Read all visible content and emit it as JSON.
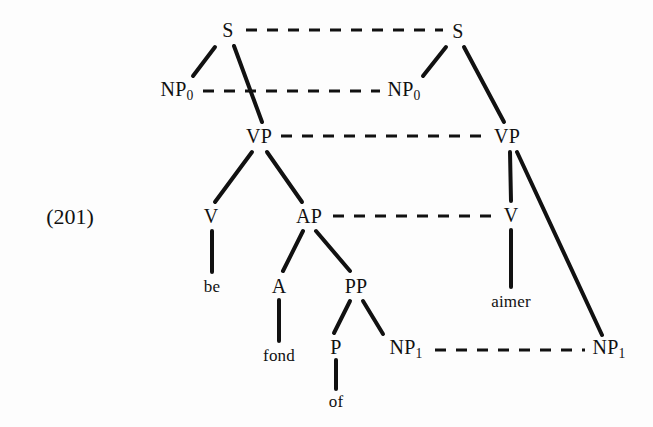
{
  "example": {
    "number_label": "(201)",
    "x": 70,
    "y": 217
  },
  "diagram": {
    "type": "syntactic-tree-pair",
    "background_color": "#fdfdfd",
    "line_color": "#111111",
    "solid_stroke_width": 4,
    "dashed_stroke_width": 3,
    "dash_pattern": "11 10"
  },
  "nodes": [
    {
      "id": "s-left",
      "label": "S",
      "sub": "",
      "kind": "category",
      "side": "left",
      "x": 228,
      "y": 30
    },
    {
      "id": "s-right",
      "label": "S",
      "sub": "",
      "kind": "category",
      "side": "right",
      "x": 458,
      "y": 31
    },
    {
      "id": "np0-left",
      "label": "NP",
      "sub": "0",
      "kind": "category",
      "side": "left",
      "x": 177,
      "y": 91
    },
    {
      "id": "np0-right",
      "label": "NP",
      "sub": "0",
      "kind": "category",
      "side": "right",
      "x": 404,
      "y": 91
    },
    {
      "id": "vp-left",
      "label": "VP",
      "sub": "",
      "kind": "category",
      "side": "left",
      "x": 259,
      "y": 136
    },
    {
      "id": "vp-right",
      "label": "VP",
      "sub": "",
      "kind": "category",
      "side": "right",
      "x": 507,
      "y": 136
    },
    {
      "id": "v-left",
      "label": "V",
      "sub": "",
      "kind": "category",
      "side": "left",
      "x": 211,
      "y": 216
    },
    {
      "id": "ap-left",
      "label": "AP",
      "sub": "",
      "kind": "category",
      "side": "left",
      "x": 309,
      "y": 216
    },
    {
      "id": "v-right",
      "label": "V",
      "sub": "",
      "kind": "category",
      "side": "right",
      "x": 511,
      "y": 215
    },
    {
      "id": "be",
      "label": "be",
      "sub": "",
      "kind": "word",
      "side": "left",
      "x": 212,
      "y": 286
    },
    {
      "id": "a-left",
      "label": "A",
      "sub": "",
      "kind": "category",
      "side": "left",
      "x": 279,
      "y": 286
    },
    {
      "id": "pp-left",
      "label": "PP",
      "sub": "",
      "kind": "category",
      "side": "left",
      "x": 356,
      "y": 286
    },
    {
      "id": "aimer",
      "label": "aimer",
      "sub": "",
      "kind": "word",
      "side": "right",
      "x": 511,
      "y": 301
    },
    {
      "id": "fond",
      "label": "fond",
      "sub": "",
      "kind": "word",
      "side": "left",
      "x": 279,
      "y": 355
    },
    {
      "id": "p-left",
      "label": "P",
      "sub": "",
      "kind": "category",
      "side": "left",
      "x": 336,
      "y": 347
    },
    {
      "id": "np1-left",
      "label": "NP",
      "sub": "1",
      "kind": "category",
      "side": "left",
      "x": 406,
      "y": 349
    },
    {
      "id": "np1-right",
      "label": "NP",
      "sub": "1",
      "kind": "category",
      "side": "right",
      "x": 609,
      "y": 349
    },
    {
      "id": "of",
      "label": "of",
      "sub": "",
      "kind": "word",
      "side": "left",
      "x": 336,
      "y": 401
    }
  ],
  "solid_edges": [
    {
      "id": "s-left-to-np0",
      "from": "s-left",
      "to": "np0-left",
      "x1": 215,
      "y1": 47,
      "x2": 193,
      "y2": 76
    },
    {
      "id": "s-left-to-vp",
      "from": "s-left",
      "to": "vp-left",
      "x1": 234,
      "y1": 46,
      "x2": 262,
      "y2": 122
    },
    {
      "id": "s-right-to-np0",
      "from": "s-right",
      "to": "np0-right",
      "x1": 446,
      "y1": 47,
      "x2": 423,
      "y2": 76
    },
    {
      "id": "s-right-to-vp",
      "from": "s-right",
      "to": "vp-right",
      "x1": 464,
      "y1": 47,
      "x2": 504,
      "y2": 122
    },
    {
      "id": "vp-left-to-v",
      "from": "vp-left",
      "to": "v-left",
      "x1": 252,
      "y1": 152,
      "x2": 215,
      "y2": 202
    },
    {
      "id": "vp-left-to-ap",
      "from": "vp-left",
      "to": "ap-left",
      "x1": 267,
      "y1": 152,
      "x2": 302,
      "y2": 202
    },
    {
      "id": "vp-right-to-v",
      "from": "vp-right",
      "to": "v-right",
      "x1": 510,
      "y1": 152,
      "x2": 511,
      "y2": 201
    },
    {
      "id": "vp-right-to-np1",
      "from": "vp-right",
      "to": "np1-right",
      "x1": 517,
      "y1": 152,
      "x2": 602,
      "y2": 335
    },
    {
      "id": "v-left-to-be",
      "from": "v-left",
      "to": "be",
      "x1": 212,
      "y1": 231,
      "x2": 212,
      "y2": 272
    },
    {
      "id": "ap-to-a",
      "from": "ap-left",
      "to": "a-left",
      "x1": 303,
      "y1": 231,
      "x2": 283,
      "y2": 271
    },
    {
      "id": "ap-to-pp",
      "from": "ap-left",
      "to": "pp-left",
      "x1": 316,
      "y1": 231,
      "x2": 350,
      "y2": 271
    },
    {
      "id": "v-right-to-aimer",
      "from": "v-right",
      "to": "aimer",
      "x1": 511,
      "y1": 230,
      "x2": 511,
      "y2": 287
    },
    {
      "id": "a-to-fond",
      "from": "a-left",
      "to": "fond",
      "x1": 279,
      "y1": 300,
      "x2": 279,
      "y2": 341
    },
    {
      "id": "pp-to-p",
      "from": "pp-left",
      "to": "p-left",
      "x1": 350,
      "y1": 301,
      "x2": 334,
      "y2": 333
    },
    {
      "id": "pp-to-np1",
      "from": "pp-left",
      "to": "np1-left",
      "x1": 363,
      "y1": 301,
      "x2": 383,
      "y2": 334
    },
    {
      "id": "p-to-of",
      "from": "p-left",
      "to": "of",
      "x1": 336,
      "y1": 360,
      "x2": 336,
      "y2": 389
    }
  ],
  "dashed_links": [
    {
      "id": "link-s",
      "from": "s-left",
      "to": "s-right",
      "x1": 246,
      "y1": 30,
      "x2": 443,
      "y2": 30
    },
    {
      "id": "link-np0",
      "from": "np0-left",
      "to": "np0-right",
      "x1": 203,
      "y1": 91,
      "x2": 380,
      "y2": 91
    },
    {
      "id": "link-vp",
      "from": "vp-left",
      "to": "vp-right",
      "x1": 281,
      "y1": 136,
      "x2": 488,
      "y2": 136
    },
    {
      "id": "link-ap-v",
      "from": "ap-left",
      "to": "v-right",
      "x1": 333,
      "y1": 216,
      "x2": 496,
      "y2": 216
    },
    {
      "id": "link-np1",
      "from": "np1-left",
      "to": "np1-right",
      "x1": 435,
      "y1": 350,
      "x2": 585,
      "y2": 350
    }
  ]
}
